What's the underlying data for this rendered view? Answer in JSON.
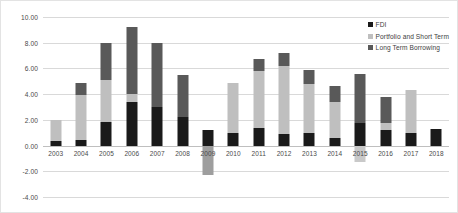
{
  "chart_data": {
    "type": "bar",
    "stacked": true,
    "title": "",
    "subtitle": "",
    "xlabel": "",
    "ylabel": "",
    "grid": true,
    "legend_position": "top-right",
    "ylim": [
      -4.0,
      10.0
    ],
    "ytick_step": 2.0,
    "ytick_labels": [
      "10.00",
      "8.00",
      "6.00",
      "4.00",
      "2.00",
      "0.00",
      "-2.00",
      "-4.00"
    ],
    "ytick_values": [
      10.0,
      8.0,
      6.0,
      4.0,
      2.0,
      0.0,
      -2.0,
      -4.0
    ],
    "categories": [
      "2003",
      "2004",
      "2005",
      "2006",
      "2007",
      "2008",
      "2009",
      "2010",
      "2011",
      "2012",
      "2013",
      "2014",
      "2015",
      "2016",
      "2017",
      "2018"
    ],
    "series": [
      {
        "name": "FDI",
        "color": "#1a1a1a",
        "values": [
          0.35,
          0.45,
          1.8,
          3.4,
          3.0,
          2.2,
          1.2,
          1.0,
          1.4,
          0.9,
          1.0,
          0.6,
          1.75,
          1.2,
          0.95,
          1.3
        ]
      },
      {
        "name": "Portfolio and Short Term",
        "color": "#bfbfbf",
        "values": [
          1.65,
          3.45,
          3.3,
          0.6,
          0.0,
          0.0,
          0.0,
          3.9,
          4.4,
          5.3,
          3.8,
          2.8,
          -1.3,
          0.55,
          3.35,
          0.0
        ]
      },
      {
        "name": "Long Term Borrowing",
        "color": "#595959",
        "values": [
          0.0,
          1.0,
          2.9,
          5.2,
          5.0,
          3.3,
          -2.3,
          0.0,
          0.9,
          1.0,
          1.1,
          1.2,
          3.85,
          2.0,
          0.0,
          0.0
        ]
      }
    ],
    "bar_totals": [
      2.0,
      4.9,
      8.0,
      9.2,
      8.0,
      5.5,
      -1.1,
      4.9,
      6.7,
      7.2,
      5.9,
      4.6,
      4.3,
      3.2,
      4.3,
      1.3
    ]
  },
  "legend": {
    "items": [
      {
        "label": "FDI"
      },
      {
        "label": "Portfolio and Short Term"
      },
      {
        "label": "Long Term Borrowing"
      }
    ]
  }
}
